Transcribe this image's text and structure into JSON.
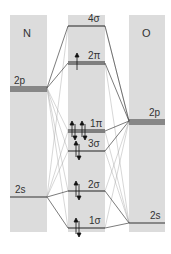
{
  "diagram": {
    "type": "molecular-orbital-diagram",
    "columns": [
      {
        "id": "N",
        "label": "N",
        "x": 10,
        "width": 37
      },
      {
        "id": "MO",
        "label": "",
        "x": 68,
        "width": 37
      },
      {
        "id": "O",
        "label": "O",
        "x": 129,
        "width": 36
      }
    ],
    "atomic_levels": {
      "N": [
        {
          "label": "2p",
          "y": 88,
          "lines": 3
        },
        {
          "label": "2s",
          "y": 197,
          "lines": 1
        }
      ],
      "O": [
        {
          "label": "2p",
          "y": 121,
          "lines": 3
        },
        {
          "label": "2s",
          "y": 223,
          "lines": 1
        }
      ]
    },
    "molecular_orbitals": [
      {
        "label": "4σ",
        "y": 26,
        "electrons": 0,
        "lines": 1
      },
      {
        "label": "2π",
        "y": 63,
        "electrons": 1,
        "lines": 2
      },
      {
        "label": "1π",
        "y": 131,
        "electrons": 4,
        "lines": 2
      },
      {
        "label": "3σ",
        "y": 151,
        "electrons": 2,
        "lines": 1
      },
      {
        "label": "2σ",
        "y": 191,
        "electrons": 2,
        "lines": 1
      },
      {
        "label": "1σ",
        "y": 228,
        "electrons": 2,
        "lines": 1
      }
    ],
    "labels": {
      "N_title": "N",
      "O_title": "O",
      "N_2p": "2p",
      "N_2s": "2s",
      "O_2p": "2p",
      "O_2s": "2s",
      "mo_4s": "4σ",
      "mo_2pi": "2π",
      "mo_1pi": "1π",
      "mo_3s": "3σ",
      "mo_2s": "2σ",
      "mo_1s": "1σ"
    }
  }
}
